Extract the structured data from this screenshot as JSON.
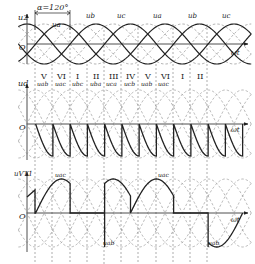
{
  "diagram": {
    "colors": {
      "ink": "#222222",
      "dash": "#888888",
      "background": "#ffffff"
    },
    "panel1": {
      "y_label": "u2",
      "x_label": "ωt",
      "origin_label": "O",
      "alpha_annotation": "α=120°",
      "phase_labels": [
        "ua",
        "ub",
        "uc",
        "ua",
        "ub",
        "uc"
      ]
    },
    "panel2": {
      "y_label": "ud",
      "x_label": "ωt",
      "origin_label": "O",
      "segment_numerals": [
        "V",
        "VI",
        "I",
        "II",
        "III",
        "IV",
        "V",
        "VI",
        "I",
        "II"
      ],
      "segment_voltages": [
        "uab",
        "uac",
        "ubc",
        "uba",
        "uca",
        "ucb",
        "uab",
        "uac"
      ]
    },
    "panel3": {
      "y_label": "uVT1",
      "x_label": "ωt",
      "origin_label": "O",
      "annotations": [
        "uac",
        "uab",
        "uac",
        "uab"
      ]
    }
  }
}
